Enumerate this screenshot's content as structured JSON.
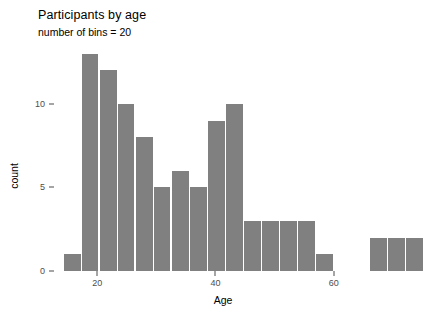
{
  "chart_data": {
    "type": "bar",
    "title": "Participants by age",
    "subtitle": "number of bins = 20",
    "xlabel": "Age",
    "ylabel": "count",
    "grid": false,
    "legend": null,
    "xlim": [
      13.2,
      79.0
    ],
    "ylim": [
      0,
      13.7
    ],
    "xticks": [
      20,
      40,
      60
    ],
    "xtick_labels": [
      "20",
      "40",
      "60"
    ],
    "yticks": [
      0,
      5,
      10
    ],
    "ytick_labels": [
      "0",
      "5",
      "10"
    ],
    "bin_width": 3.05,
    "bin_count": 20,
    "bar_color": "#808080",
    "categories": [
      "14.3",
      "17.4",
      "20.4",
      "23.5",
      "26.5",
      "29.6",
      "32.6",
      "35.7",
      "38.7",
      "41.8",
      "44.8",
      "47.9",
      "50.9",
      "54.0",
      "57.0",
      "60.1",
      "63.1",
      "66.2",
      "69.2",
      "72.3"
    ],
    "values": [
      1,
      13,
      12,
      10,
      8,
      5,
      6,
      5,
      9,
      10,
      3,
      3,
      3,
      3,
      1,
      0,
      0,
      2,
      2,
      2
    ],
    "bars": [
      {
        "bin_start": 14.3,
        "bin_end": 17.4,
        "count": 1
      },
      {
        "bin_start": 17.4,
        "bin_end": 20.4,
        "count": 13
      },
      {
        "bin_start": 20.4,
        "bin_end": 23.5,
        "count": 12
      },
      {
        "bin_start": 23.5,
        "bin_end": 26.5,
        "count": 10
      },
      {
        "bin_start": 26.5,
        "bin_end": 29.6,
        "count": 8
      },
      {
        "bin_start": 29.6,
        "bin_end": 32.6,
        "count": 5
      },
      {
        "bin_start": 32.6,
        "bin_end": 35.7,
        "count": 6
      },
      {
        "bin_start": 35.7,
        "bin_end": 38.7,
        "count": 5
      },
      {
        "bin_start": 38.7,
        "bin_end": 41.8,
        "count": 9
      },
      {
        "bin_start": 41.8,
        "bin_end": 44.8,
        "count": 10
      },
      {
        "bin_start": 44.8,
        "bin_end": 47.9,
        "count": 3
      },
      {
        "bin_start": 47.9,
        "bin_end": 50.9,
        "count": 3
      },
      {
        "bin_start": 50.9,
        "bin_end": 54.0,
        "count": 3
      },
      {
        "bin_start": 54.0,
        "bin_end": 57.0,
        "count": 3
      },
      {
        "bin_start": 57.0,
        "bin_end": 60.1,
        "count": 1
      },
      {
        "bin_start": 60.1,
        "bin_end": 63.1,
        "count": 0
      },
      {
        "bin_start": 63.1,
        "bin_end": 66.2,
        "count": 0
      },
      {
        "bin_start": 66.2,
        "bin_end": 69.2,
        "count": 2
      },
      {
        "bin_start": 69.2,
        "bin_end": 72.3,
        "count": 2
      },
      {
        "bin_start": 72.3,
        "bin_end": 75.3,
        "count": 2
      }
    ]
  }
}
